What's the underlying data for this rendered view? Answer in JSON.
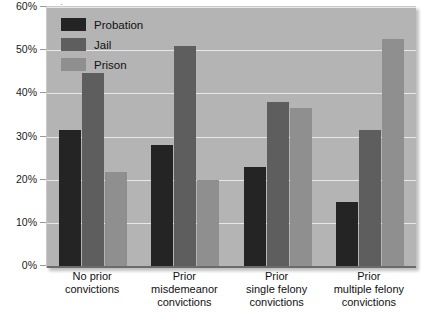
{
  "title_sliver": "·",
  "legend": {
    "position": "top-left-inside",
    "items": [
      {
        "label": "Probation",
        "color": "#242424"
      },
      {
        "label": "Jail",
        "color": "#5e5e5e"
      },
      {
        "label": "Prison",
        "color": "#8f8f8f"
      }
    ]
  },
  "axis": {
    "y_ticks": [
      "0%",
      "10%",
      "20%",
      "30%",
      "40%",
      "50%",
      "60%"
    ]
  },
  "chart_data": {
    "type": "bar",
    "title": "",
    "xlabel": "",
    "ylabel": "",
    "ylim": [
      0,
      60
    ],
    "ytick_values": [
      0,
      10,
      20,
      30,
      40,
      50,
      60
    ],
    "ytick_labels": [
      "0%",
      "10%",
      "20%",
      "30%",
      "40%",
      "50%",
      "60%"
    ],
    "grid": true,
    "legend_position": "upper left",
    "categories": [
      "No prior convictions",
      "Prior misdemeanor convictions",
      "Prior single felony convictions",
      "Prior multiple felony convictions"
    ],
    "category_lines": [
      [
        "No prior",
        "convictions"
      ],
      [
        "Prior",
        "misdemeanor",
        "convictions"
      ],
      [
        "Prior",
        "single felony",
        "convictions"
      ],
      [
        "Prior",
        "multiple felony",
        "convictions"
      ]
    ],
    "series": [
      {
        "name": "Probation",
        "color": "#242424",
        "values": [
          31.5,
          28.0,
          23.0,
          14.8
        ]
      },
      {
        "name": "Jail",
        "color": "#5e5e5e",
        "values": [
          44.8,
          51.0,
          38.0,
          31.5
        ]
      },
      {
        "name": "Prison",
        "color": "#8f8f8f",
        "values": [
          21.7,
          20.0,
          36.6,
          52.6
        ]
      }
    ]
  },
  "colors": {
    "plot_background": "#b4b4b4",
    "gridline": "#e8e8e8",
    "axis": "#6b6b6b",
    "page_background": "#ffffff"
  }
}
